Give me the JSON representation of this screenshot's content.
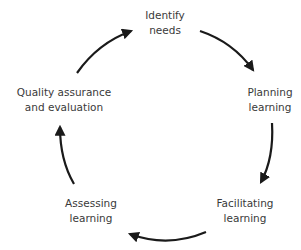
{
  "diagram": {
    "type": "cycle",
    "direction": "clockwise",
    "stroke_color": "#1a1a1a",
    "nodes": [
      {
        "id": "identify",
        "lines": [
          "Identify",
          "needs"
        ]
      },
      {
        "id": "planning",
        "lines": [
          "Planning",
          "learning"
        ]
      },
      {
        "id": "facilitating",
        "lines": [
          "Facilitating",
          "learning"
        ]
      },
      {
        "id": "assessing",
        "lines": [
          "Assessing",
          "learning"
        ]
      },
      {
        "id": "quality",
        "lines": [
          "Quality assurance",
          "and evaluation"
        ]
      }
    ],
    "edges": [
      {
        "from": "identify",
        "to": "planning"
      },
      {
        "from": "planning",
        "to": "facilitating"
      },
      {
        "from": "facilitating",
        "to": "assessing"
      },
      {
        "from": "assessing",
        "to": "quality"
      },
      {
        "from": "quality",
        "to": "identify"
      }
    ]
  }
}
